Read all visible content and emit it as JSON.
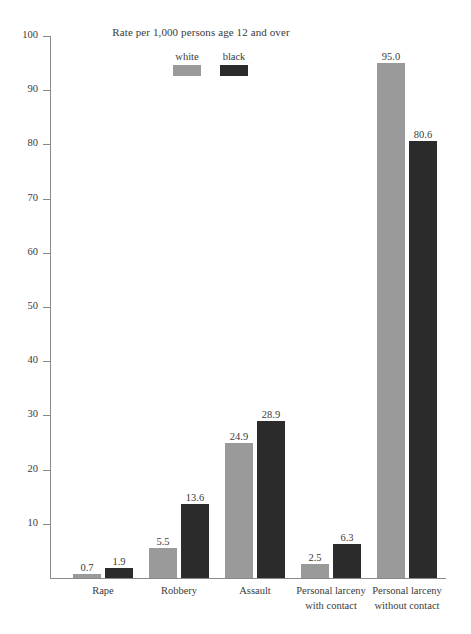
{
  "chart_data": {
    "type": "bar",
    "title": "Rate per 1,000 persons age 12 and over",
    "xlabel": "",
    "ylabel": "",
    "ylim": [
      0,
      100
    ],
    "yticks": [
      10,
      20,
      30,
      40,
      50,
      60,
      70,
      80,
      90,
      100
    ],
    "grid": false,
    "legend_position": "top-center",
    "categories": [
      "Rape",
      "Robbery",
      "Assault",
      "Personal larceny with contact",
      "Personal larceny without contact"
    ],
    "category_lines": [
      [
        "Rape",
        ""
      ],
      [
        "Robbery",
        ""
      ],
      [
        "Assault",
        ""
      ],
      [
        "Personal larceny",
        "with contact"
      ],
      [
        "Personal larceny",
        "without contact"
      ]
    ],
    "series": [
      {
        "name": "white",
        "color": "#9a9a9a",
        "values": [
          0.7,
          5.5,
          24.9,
          2.5,
          95.0
        ],
        "labels": [
          "0.7",
          "5.5",
          "24.9",
          "2.5",
          "95.0"
        ]
      },
      {
        "name": "black",
        "color": "#2b2b2b",
        "values": [
          1.9,
          13.6,
          28.9,
          6.3,
          80.6
        ],
        "labels": [
          "1.9",
          "13.6",
          "28.9",
          "6.3",
          "80.6"
        ]
      }
    ]
  },
  "axis": {
    "tick_labels": [
      "100",
      "90",
      "80",
      "70",
      "60",
      "50",
      "40",
      "30",
      "20",
      "10"
    ]
  },
  "legend": {
    "items": [
      {
        "label": "white",
        "color": "#9a9a9a"
      },
      {
        "label": "black",
        "color": "#2b2b2b"
      }
    ]
  },
  "colors": {
    "white_series": "#9a9a9a",
    "black_series": "#2b2b2b",
    "axis": "#8a8a8a",
    "text": "#3a3a3a",
    "background": "#ffffff"
  }
}
